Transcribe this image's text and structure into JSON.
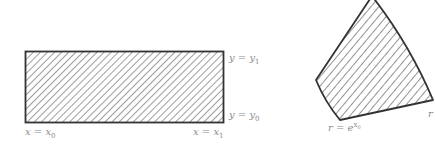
{
  "figures": {
    "rectangle": {
      "top_label": {
        "lhs": "y = y",
        "sub": "1"
      },
      "bottom_label": {
        "lhs": "y = y",
        "sub": "0"
      },
      "left_label": {
        "lhs": "x = x",
        "sub": "0"
      },
      "right_label": {
        "lhs": "x = x",
        "sub": "1"
      }
    },
    "sector": {
      "inner_label": {
        "lhs": "r = e",
        "sup": "x",
        "supsub": "0"
      },
      "outer_label": {
        "lhs": "r"
      }
    }
  },
  "colors": {
    "stroke": "#333333",
    "hatch": "#4a4a4a",
    "label": "#8a8a8a",
    "background": "#ffffff"
  }
}
